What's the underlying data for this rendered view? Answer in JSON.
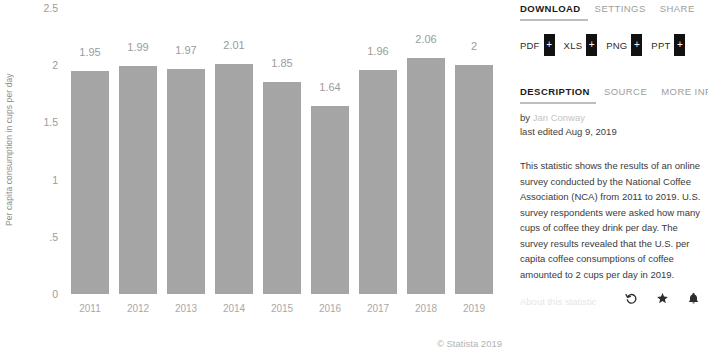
{
  "chart_data": {
    "type": "bar",
    "title": "",
    "subtitle": "",
    "xlabel": "",
    "ylabel": "Per capita consumption in cups per day",
    "categories": [
      "2011",
      "2012",
      "2013",
      "2014",
      "2015",
      "2016",
      "2017",
      "2018",
      "2019"
    ],
    "values": [
      1.95,
      1.99,
      1.97,
      2.01,
      1.85,
      1.64,
      1.96,
      2.06,
      2
    ],
    "value_labels": [
      "1.95",
      "1.99",
      "1.97",
      "2.01",
      "1.85",
      "1.64",
      "1.96",
      "2.06",
      "2"
    ],
    "ylim": [
      0,
      2.5
    ],
    "yticks": [
      2.5,
      2,
      1.5,
      1,
      0.5,
      0
    ],
    "ytick_labels": [
      "2.5",
      "2",
      "1.5",
      "1",
      ".5",
      "0"
    ],
    "grid": false,
    "legend": false,
    "bar_color": "#a5a5a5"
  },
  "chart": {
    "copyright": "© Statista 2019"
  },
  "panel": {
    "download_tabs": [
      {
        "label": "DOWNLOAD",
        "active": true
      },
      {
        "label": "SETTINGS",
        "active": false
      },
      {
        "label": "SHARE",
        "active": false
      }
    ],
    "download_buttons": [
      {
        "label": "PDF",
        "plus": "+"
      },
      {
        "label": "XLS",
        "plus": "+"
      },
      {
        "label": "PNG",
        "plus": "+"
      },
      {
        "label": "PPT",
        "plus": "+"
      }
    ],
    "info_tabs": [
      {
        "label": "DESCRIPTION",
        "active": true
      },
      {
        "label": "SOURCE",
        "active": false
      },
      {
        "label": "MORE INFO",
        "active": false
      }
    ],
    "byline_prefix": "by ",
    "author": "Jan Conway",
    "last_edited": "last edited Aug 9, 2019",
    "description": "This statistic shows the results of an online survey conducted by the National Coffee Association (NCA) from 2011 to 2019. U.S. survey respondents were asked how many cups of coffee they drink per day. The survey results revealed that the U.S. per capita coffee consumptions of coffee amounted to 2 cups per day in 2019.",
    "about_link": "About this statistic",
    "action_icons": [
      "history-icon",
      "star-icon",
      "bell-icon"
    ]
  },
  "colors": {
    "bar": "#a5a5a5",
    "accent_underline": "#bdbdbd",
    "button_black": "#111111",
    "muted_text": "#9b9b9b"
  }
}
